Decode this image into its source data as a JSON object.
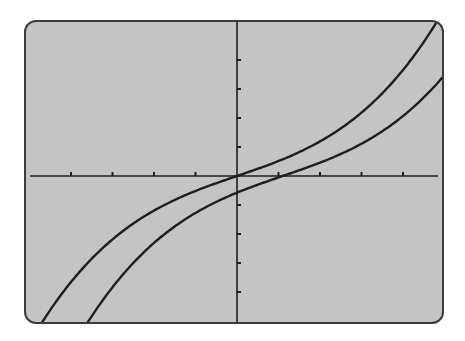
{
  "chart_data": {
    "type": "line",
    "title": "",
    "xlabel": "",
    "ylabel": "",
    "grid": false,
    "legend": null,
    "axes": {
      "x_ticks_per_side": 4,
      "y_ticks_per_side": 4,
      "xlim": [
        -5,
        5
      ],
      "ylim": [
        -5.2,
        5.2
      ],
      "tick_labels": "none"
    },
    "series": [
      {
        "name": "f(x) = 0.49x + 0.0265x^3",
        "description": "odd cubic through origin",
        "x": [
          -4.65,
          -3.7,
          -3,
          -2,
          -1,
          0,
          1,
          2,
          3,
          3.7,
          4.65
        ],
        "y": [
          -5.03,
          -3.15,
          -2.19,
          -1.19,
          -0.52,
          0,
          0.52,
          1.19,
          2.19,
          3.15,
          5.03
        ]
      },
      {
        "name": "g(x) = f(x - 1.1)",
        "description": "same cubic shifted right ~1.1 units",
        "x": [
          -3.45,
          -2,
          -1,
          0,
          1.1,
          2,
          3,
          4,
          4.95
        ],
        "y": [
          -5.03,
          -2.23,
          -1.39,
          -0.58,
          0,
          0.46,
          1.11,
          2.07,
          3.4
        ]
      }
    ]
  },
  "screen": {
    "background": "#c4c4c4",
    "border": "#3c3c3c",
    "curve_color": "#1e1e1e"
  }
}
